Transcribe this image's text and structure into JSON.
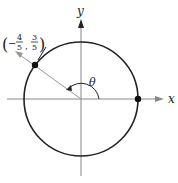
{
  "diagram": {
    "x_axis_label": "x",
    "y_axis_label": "y",
    "angle_label": "θ",
    "point": {
      "x_num": "4",
      "x_den": "5",
      "x_sign": "−",
      "y_num": "3",
      "y_den": "5"
    },
    "colors": {
      "axis": "#888888",
      "circle": "#222222",
      "point": "#111111"
    }
  }
}
